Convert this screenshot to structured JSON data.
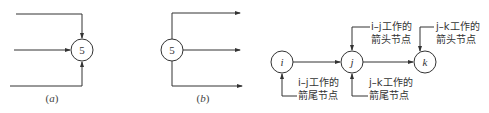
{
  "diagram_a": {
    "caption": "(a)",
    "node_label": "5",
    "description": "three arrows converge into node 5"
  },
  "diagram_b": {
    "caption": "(b)",
    "node_label": "5",
    "description": "three arrows diverge from node 5"
  },
  "diagram_c": {
    "nodes": [
      {
        "id": "i",
        "label": "i"
      },
      {
        "id": "j",
        "label": "j"
      },
      {
        "id": "k",
        "label": "k"
      }
    ],
    "annotations": {
      "ij_head_line1": "i–j工作的",
      "ij_head_line2": "箭头节点",
      "jk_head_line1": "j–k工作的",
      "jk_head_line2": "箭头节点",
      "ij_tail_line1": "i–j工作的",
      "ij_tail_line2": "箭尾节点",
      "jk_tail_line1": "j–k工作的",
      "jk_tail_line2": "箭尾节点"
    }
  },
  "colors": {
    "stroke": "#333333",
    "background": "#ffffff"
  }
}
